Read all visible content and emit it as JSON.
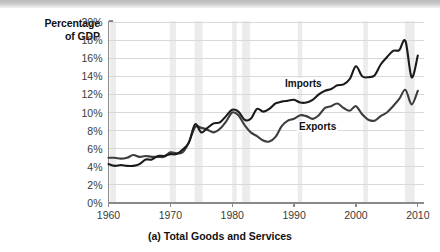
{
  "figure": {
    "caption": "(a) Total Goods and Services",
    "y_axis_title_line1": "Percentage",
    "y_axis_title_line2": "of GDP"
  },
  "colors": {
    "imports_line": "#1a1a1a",
    "exports_line": "#3d3d3d",
    "gridline": "#d9d9d9",
    "axis": "#8a8a8a",
    "recession_band": "#ececec",
    "top_band": "#c4c4c4",
    "tick_text": "#3a3a3a",
    "title_text": "#111111"
  },
  "chart_data": {
    "type": "line",
    "title": "(a) Total Goods and Services",
    "xlabel": "",
    "ylabel": "Percentage of GDP",
    "xlim": [
      1960,
      2011
    ],
    "ylim": [
      0,
      20
    ],
    "grid": true,
    "legend_position": "inline-annotation",
    "y_tick_labels": [
      "0%",
      "2%",
      "4%",
      "6%",
      "8%",
      "10%",
      "12%",
      "14%",
      "16%",
      "18%",
      "20%"
    ],
    "y_tick_values": [
      0,
      2,
      4,
      6,
      8,
      10,
      12,
      14,
      16,
      18,
      20
    ],
    "x_tick_labels": [
      "1960",
      "1970",
      "1980",
      "1990",
      "2000",
      "2010"
    ],
    "x_tick_values": [
      1960,
      1970,
      1980,
      1990,
      2000,
      2010
    ],
    "recession_bands": [
      {
        "start": 1960.2,
        "end": 1961.2
      },
      {
        "start": 1969.9,
        "end": 1970.9
      },
      {
        "start": 1973.9,
        "end": 1975.2
      },
      {
        "start": 1980.0,
        "end": 1980.6
      },
      {
        "start": 1981.6,
        "end": 1982.9
      },
      {
        "start": 1990.6,
        "end": 1991.2
      },
      {
        "start": 2001.2,
        "end": 2001.9
      },
      {
        "start": 2007.9,
        "end": 2009.5
      }
    ],
    "x": [
      1960,
      1961,
      1962,
      1963,
      1964,
      1965,
      1966,
      1967,
      1968,
      1969,
      1970,
      1971,
      1972,
      1973,
      1974,
      1975,
      1976,
      1977,
      1978,
      1979,
      1980,
      1981,
      1982,
      1983,
      1984,
      1985,
      1986,
      1987,
      1988,
      1989,
      1990,
      1991,
      1992,
      1993,
      1994,
      1995,
      1996,
      1997,
      1998,
      1999,
      2000,
      2001,
      2002,
      2003,
      2004,
      2005,
      2006,
      2007,
      2008,
      2009,
      2010
    ],
    "series": [
      {
        "name": "Exports",
        "label": "Exports",
        "values": [
          5.0,
          5.0,
          4.9,
          5.0,
          5.3,
          5.1,
          5.2,
          5.1,
          5.1,
          5.1,
          5.6,
          5.5,
          5.6,
          6.7,
          8.4,
          8.3,
          8.1,
          7.8,
          8.2,
          9.0,
          10.0,
          9.7,
          8.6,
          7.8,
          7.4,
          6.9,
          6.8,
          7.3,
          8.5,
          9.1,
          9.3,
          9.7,
          9.6,
          9.3,
          9.7,
          10.5,
          10.7,
          11.0,
          10.5,
          10.2,
          10.7,
          9.8,
          9.2,
          9.1,
          9.6,
          10.0,
          10.7,
          11.5,
          12.5,
          10.9,
          12.4
        ]
      },
      {
        "name": "Imports",
        "label": "Imports",
        "values": [
          4.3,
          4.1,
          4.2,
          4.1,
          4.1,
          4.3,
          4.8,
          4.8,
          5.2,
          5.2,
          5.4,
          5.4,
          5.9,
          6.7,
          8.7,
          7.8,
          8.3,
          8.8,
          8.9,
          9.6,
          10.3,
          10.1,
          9.2,
          9.3,
          10.4,
          10.1,
          10.4,
          11.0,
          11.2,
          11.3,
          11.4,
          11.1,
          11.1,
          11.4,
          12.0,
          12.4,
          12.6,
          13.0,
          13.1,
          13.7,
          15.1,
          14.0,
          13.9,
          14.1,
          15.3,
          16.1,
          16.8,
          16.9,
          17.9,
          13.9,
          16.3
        ]
      }
    ]
  }
}
